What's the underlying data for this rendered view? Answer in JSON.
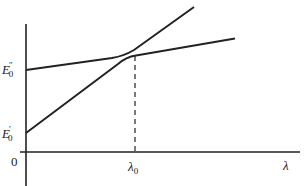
{
  "diagram": {
    "type": "energy-level avoided crossing",
    "axes": {
      "x_label": "λ",
      "origin_label": "0",
      "x_tick_label": {
        "symbol": "λ",
        "subscript": "0"
      }
    },
    "y_labels": [
      {
        "symbol": "E",
        "superscript": "″",
        "subscript": "0",
        "id": "E0-double-prime"
      },
      {
        "symbol": "E",
        "superscript": "′",
        "subscript": "0",
        "id": "E0-prime"
      }
    ],
    "curves": [
      {
        "name": "upper-branch",
        "description": "starts at E0'' nearly flat, bends upward near λ0 and rises steeply"
      },
      {
        "name": "lower-branch",
        "description": "starts at E0' rising steeply, bends near λ0 and continues nearly flat"
      }
    ],
    "markers": [
      {
        "type": "dashed-vertical",
        "at": "λ0"
      }
    ],
    "colors": {
      "line": "#222222",
      "background": "#ffffff"
    }
  }
}
